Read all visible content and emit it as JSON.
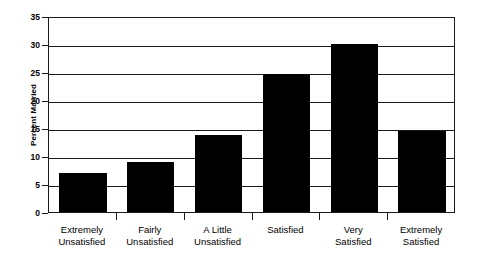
{
  "chart_data": {
    "type": "bar",
    "title": "",
    "subtitle": "",
    "xlabel": "",
    "ylabel": "Percent Married",
    "categories": [
      "Extremely\nUnsatisfied",
      "Fairly\nUnsatisfied",
      "A Little\nUnsatisfied",
      "Satisfied",
      "Very\nSatisfied",
      "Extremely\nSatisfied"
    ],
    "values": [
      6.9,
      9.0,
      13.8,
      24.6,
      30.0,
      14.4
    ],
    "ylim": [
      0,
      35
    ],
    "ytick_labels": [
      "0",
      "5",
      "10",
      "15",
      "20",
      "25",
      "30",
      "35"
    ],
    "ytick_values": [
      0,
      5,
      10,
      15,
      20,
      25,
      30,
      35
    ],
    "grid": "horizontal",
    "legend": "none",
    "bar_color": "#000000",
    "axis_color": "#1a1a1a",
    "background_color": "#ffffff"
  }
}
